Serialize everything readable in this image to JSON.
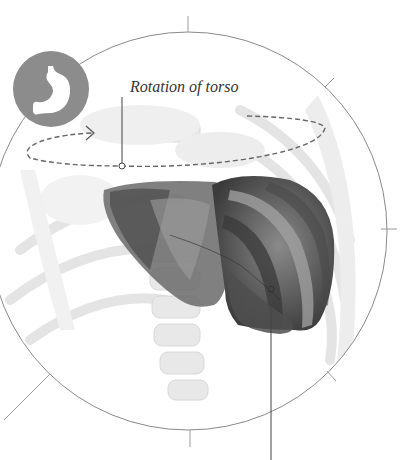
{
  "diagram": {
    "labels": {
      "rotation": "Rotation of torso"
    },
    "icon": {
      "name": "stomach-icon",
      "background": "#8c8c8c",
      "foreground": "#ffffff"
    },
    "colors": {
      "outline": "#8a8a8a",
      "dash": "#666666",
      "organ_dark": "#3f3f3f",
      "organ_mid": "#6e6e6e",
      "organ_light": "#a9a9a9",
      "skeleton": "#e4e4e4"
    },
    "callouts": [
      {
        "name": "rotation-callout",
        "anchor": [
          122,
          166
        ]
      },
      {
        "name": "liver-callout",
        "anchor": [
          271,
          289
        ]
      }
    ]
  }
}
